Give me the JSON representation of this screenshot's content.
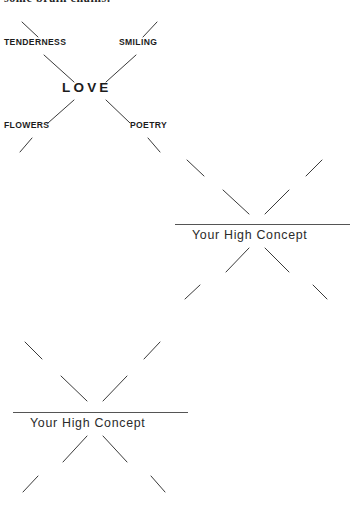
{
  "page": {
    "cutoff_line": "some brain chains.",
    "background_color": "#ffffff",
    "ink_color": "#1c1c1c",
    "rule_color": "#555555"
  },
  "diagrams": [
    {
      "id": "love-cluster",
      "kind": "filled-example",
      "hub_label": "LOVE",
      "spokes": [
        {
          "label": "TENDERNESS",
          "position": "top-left"
        },
        {
          "label": "SMILING",
          "position": "top-right"
        },
        {
          "label": "FLOWERS",
          "position": "bottom-left"
        },
        {
          "label": "POETRY",
          "position": "bottom-right"
        }
      ]
    },
    {
      "id": "template-upper-right",
      "kind": "blank-template",
      "hub_label": "Your High Concept",
      "spokes": [
        {
          "label": "",
          "position": "top-left"
        },
        {
          "label": "",
          "position": "top-right"
        },
        {
          "label": "",
          "position": "bottom-left"
        },
        {
          "label": "",
          "position": "bottom-right"
        }
      ]
    },
    {
      "id": "template-lower-left",
      "kind": "blank-template",
      "hub_label": "Your High Concept",
      "spokes": [
        {
          "label": "",
          "position": "top-left"
        },
        {
          "label": "",
          "position": "top-right"
        },
        {
          "label": "",
          "position": "bottom-left"
        },
        {
          "label": "",
          "position": "bottom-right"
        }
      ]
    }
  ]
}
